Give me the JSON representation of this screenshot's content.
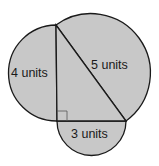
{
  "figure": {
    "fill_color": "#c8c8c8",
    "stroke_color": "#1a1a1a",
    "triangle": {
      "vertices": {
        "top": [
          56,
          25
        ],
        "right_angle": [
          57,
          121
        ],
        "bottom_right": [
          126,
          121
        ]
      },
      "right_angle_marker": true
    },
    "labels": {
      "left_side": "4 units",
      "hypotenuse": "5 units",
      "bottom_side": "3 units"
    }
  }
}
